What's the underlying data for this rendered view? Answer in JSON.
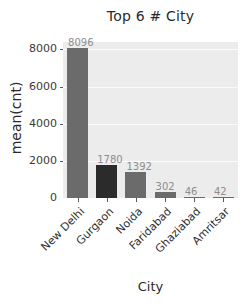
{
  "chart_data": {
    "type": "bar",
    "title": "Top 6 # City",
    "xlabel": "City",
    "ylabel": "mean(cnt)",
    "categories": [
      "New Delhi",
      "Gurgaon",
      "Noida",
      "Faridabad",
      "Ghaziabad",
      "Amritsar"
    ],
    "values": [
      8096,
      1780,
      1392,
      302,
      46,
      42
    ],
    "value_labels": [
      "8096",
      "1780",
      "1392",
      "302",
      "46",
      "42"
    ],
    "bar_colors": [
      "#6b6b6b",
      "#2b2b2b",
      "#6b6b6b",
      "#6b6b6b",
      "#6b6b6b",
      "#6b6b6b"
    ],
    "ylim": [
      0,
      8400
    ],
    "yticks": [
      0,
      2000,
      4000,
      6000,
      8000
    ],
    "ytick_labels": [
      "0",
      "2000",
      "4000",
      "6000",
      "8000"
    ],
    "grid": true,
    "grid_color": "#fbfbfb",
    "plot_background": "#ececec",
    "figure_background": "#ffffff",
    "legend": null,
    "xtick_rotation": -45
  }
}
